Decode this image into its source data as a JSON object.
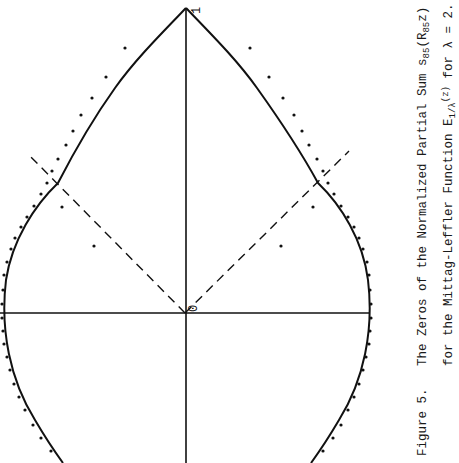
{
  "figure": {
    "label": "Figure 5.",
    "caption_line1": {
      "prefix": "The Zeros of the Normalized Partial Sum s",
      "sub1": "85",
      "mid": "(R",
      "sub2": "85",
      "suffix": "z)"
    },
    "caption_line2": {
      "prefix": "for the Mittag-Leffler Function E",
      "sub": "1/λ",
      "sup": "(z)",
      "suffix": " for λ = 2."
    },
    "point_labels": {
      "one": "1",
      "zero": "0"
    },
    "orientation": "rotated 90deg counter-clockwise (real axis vertical, 1 at top)"
  },
  "chart_data": {
    "type": "scatter",
    "xlabel": "",
    "ylabel": "",
    "annotations": [
      "1",
      "0"
    ],
    "grid": false,
    "elements": {
      "curve": "solid teardrop boundary (Szegő-type curve) passing through 1 with corners on the dashed rays",
      "dashed_rays": "two dashed rays from 0 at ± angle (about ±45° from the real axis toward 1)",
      "axes": "real axis (from 0 to 1) and imaginary axis through 0",
      "zeros": "dots along the boundary plus two interior zeros on each side"
    },
    "pixel_points_left": [
      [
        125,
        48
      ],
      [
        106,
        77
      ],
      [
        92,
        98
      ],
      [
        81,
        115
      ],
      [
        73,
        131
      ],
      [
        66,
        145
      ],
      [
        58,
        159
      ],
      [
        52,
        171
      ],
      [
        47,
        183
      ],
      [
        41,
        194
      ],
      [
        34,
        206
      ],
      [
        27,
        217
      ],
      [
        21,
        227
      ],
      [
        15,
        238
      ],
      [
        11,
        249
      ],
      [
        7,
        262
      ],
      [
        4,
        275
      ],
      [
        3,
        290
      ],
      [
        2,
        304
      ],
      [
        2,
        318
      ],
      [
        3,
        331
      ],
      [
        4,
        344
      ],
      [
        7,
        357
      ],
      [
        10,
        370
      ],
      [
        14,
        384
      ],
      [
        19,
        397
      ],
      [
        25,
        410
      ],
      [
        33,
        425
      ],
      [
        41,
        438
      ],
      [
        51,
        451
      ],
      [
        62,
        207
      ],
      [
        94,
        246
      ]
    ],
    "pixel_points_right": [
      [
        250,
        48
      ],
      [
        269,
        77
      ],
      [
        283,
        98
      ],
      [
        294,
        115
      ],
      [
        302,
        131
      ],
      [
        309,
        145
      ],
      [
        317,
        159
      ],
      [
        323,
        171
      ],
      [
        328,
        183
      ],
      [
        334,
        194
      ],
      [
        341,
        206
      ],
      [
        348,
        217
      ],
      [
        354,
        227
      ],
      [
        359,
        238
      ],
      [
        363,
        249
      ],
      [
        367,
        262
      ],
      [
        369,
        275
      ],
      [
        370,
        290
      ],
      [
        371,
        304
      ],
      [
        371,
        318
      ],
      [
        370,
        331
      ],
      [
        369,
        344
      ],
      [
        366,
        357
      ],
      [
        363,
        370
      ],
      [
        359,
        384
      ],
      [
        354,
        397
      ],
      [
        348,
        410
      ],
      [
        341,
        425
      ],
      [
        333,
        438
      ],
      [
        323,
        451
      ],
      [
        313,
        207
      ],
      [
        281,
        246
      ]
    ],
    "origin_px": [
      185,
      313
    ],
    "one_px": [
      186,
      8
    ]
  }
}
